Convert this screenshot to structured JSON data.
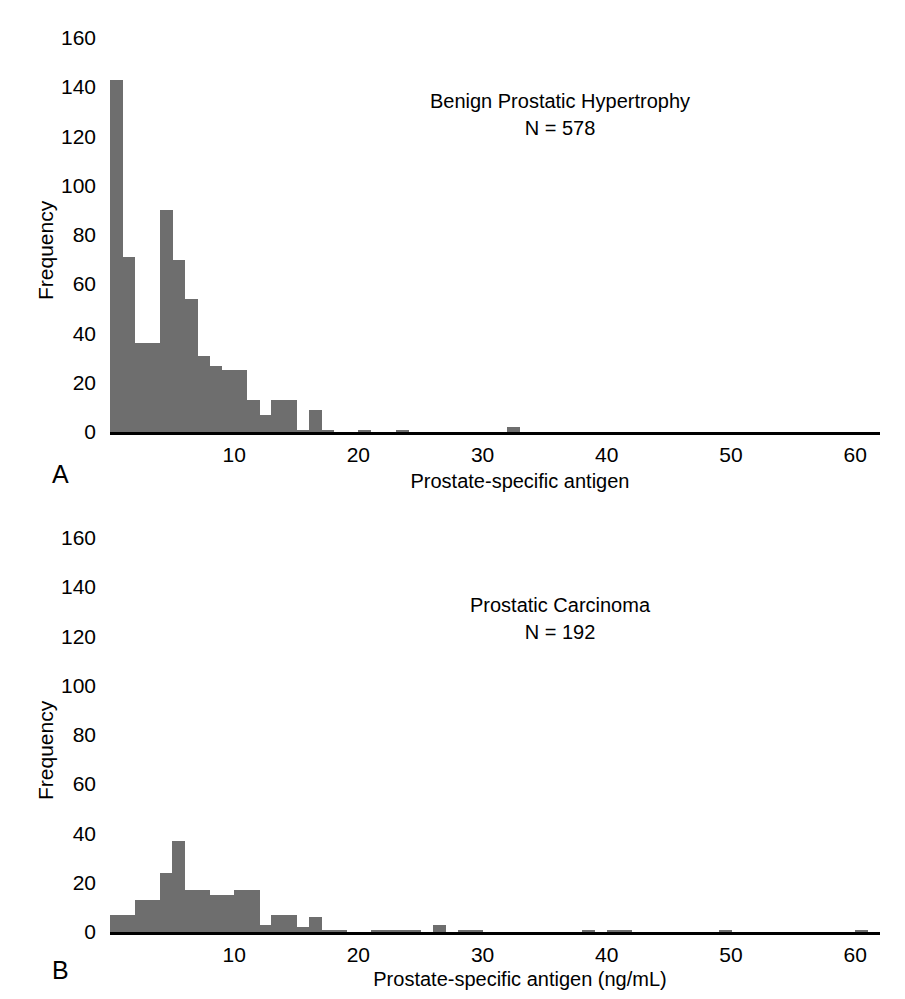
{
  "figure": {
    "background": "#ffffff",
    "bar_color": "#6e6e6e",
    "axis_color": "#000000"
  },
  "panel_a": {
    "letter": "A",
    "title_line1": "Benign Prostatic Hypertrophy",
    "title_line2": "N = 578",
    "ylabel": "Frequency",
    "xlabel": "Prostate-specific antigen",
    "yticks": [
      "160",
      "140",
      "120",
      "100",
      "80",
      "60",
      "40",
      "20",
      "0"
    ],
    "xticks": [
      "10",
      "20",
      "30",
      "40",
      "50",
      "60"
    ]
  },
  "panel_b": {
    "letter": "B",
    "title_line1": "Prostatic Carcinoma",
    "title_line2": "N = 192",
    "ylabel": "Frequency",
    "xlabel": "Prostate-specific antigen (ng/mL)",
    "yticks": [
      "160",
      "140",
      "120",
      "100",
      "80",
      "60",
      "40",
      "20",
      "0"
    ],
    "xticks": [
      "10",
      "20",
      "30",
      "40",
      "50",
      "60"
    ]
  },
  "chart_data": [
    {
      "type": "bar",
      "panel": "A",
      "title": "Benign Prostatic Hypertrophy",
      "subtitle": "N = 578",
      "xlabel": "Prostate-specific antigen",
      "ylabel": "Frequency",
      "xlim": [
        0,
        62
      ],
      "ylim": [
        0,
        160
      ],
      "xticks": [
        10,
        20,
        30,
        40,
        50,
        60
      ],
      "yticks": [
        0,
        20,
        40,
        60,
        80,
        100,
        120,
        140,
        160
      ],
      "grid": false,
      "legend": "none",
      "bin_width": 1,
      "bin_starts": [
        0,
        1,
        2,
        3,
        4,
        5,
        6,
        7,
        8,
        9,
        10,
        11,
        12,
        13,
        14,
        15,
        16,
        17,
        18,
        19,
        20,
        21,
        22,
        23,
        24,
        25,
        26,
        27,
        28,
        29,
        30,
        31,
        32,
        33
      ],
      "values": [
        143,
        71,
        36,
        36,
        90,
        70,
        54,
        31,
        27,
        25,
        25,
        13,
        7,
        13,
        13,
        1,
        9,
        1,
        0,
        0,
        1,
        0,
        0,
        1,
        0,
        0,
        0,
        0,
        0,
        0,
        0,
        0,
        2,
        0
      ],
      "categories": [
        "0-1",
        "1-2",
        "2-3",
        "3-4",
        "4-5",
        "5-6",
        "6-7",
        "7-8",
        "8-9",
        "9-10",
        "10-11",
        "11-12",
        "12-13",
        "13-14",
        "14-15",
        "15-16",
        "16-17",
        "17-18",
        "18-19",
        "19-20",
        "20-21",
        "21-22",
        "22-23",
        "23-24",
        "24-25",
        "25-26",
        "26-27",
        "27-28",
        "28-29",
        "29-30",
        "30-31",
        "31-32",
        "32-33",
        "33-34"
      ]
    },
    {
      "type": "bar",
      "panel": "B",
      "title": "Prostatic Carcinoma",
      "subtitle": "N = 192",
      "xlabel": "Prostate-specific antigen (ng/mL)",
      "ylabel": "Frequency",
      "xlim": [
        0,
        62
      ],
      "ylim": [
        0,
        160
      ],
      "xticks": [
        10,
        20,
        30,
        40,
        50,
        60
      ],
      "yticks": [
        0,
        20,
        40,
        60,
        80,
        100,
        120,
        140,
        160
      ],
      "grid": false,
      "legend": "none",
      "bin_width": 1,
      "bin_starts": [
        0,
        1,
        2,
        3,
        4,
        5,
        6,
        7,
        8,
        9,
        10,
        11,
        12,
        13,
        14,
        15,
        16,
        17,
        18,
        19,
        20,
        21,
        22,
        23,
        24,
        25,
        26,
        27,
        28,
        29,
        30,
        31,
        32,
        33,
        34,
        35,
        36,
        37,
        38,
        39,
        40,
        41,
        42,
        43,
        44,
        45,
        46,
        47,
        48,
        49,
        50,
        51,
        52,
        53,
        54,
        55,
        56,
        57,
        58,
        59,
        60,
        61
      ],
      "values": [
        7,
        7,
        13,
        13,
        24,
        37,
        17,
        17,
        15,
        15,
        17,
        17,
        3,
        7,
        7,
        2,
        6,
        1,
        1,
        0,
        0,
        1,
        1,
        1,
        1,
        0,
        3,
        0,
        1,
        1,
        0,
        0,
        0,
        0,
        0,
        0,
        0,
        0,
        1,
        0,
        1,
        1,
        0,
        0,
        0,
        0,
        0,
        0,
        0,
        1,
        0,
        0,
        0,
        0,
        0,
        0,
        0,
        0,
        0,
        0,
        1,
        0
      ],
      "categories": [
        "0-1",
        "1-2",
        "2-3",
        "3-4",
        "4-5",
        "5-6",
        "6-7",
        "7-8",
        "8-9",
        "9-10",
        "10-11",
        "11-12",
        "12-13",
        "13-14",
        "14-15",
        "15-16",
        "16-17",
        "17-18",
        "18-19",
        "19-20",
        "20-21",
        "21-22",
        "22-23",
        "23-24",
        "24-25",
        "25-26",
        "26-27",
        "27-28",
        "28-29",
        "29-30",
        "30-31",
        "31-32",
        "32-33",
        "33-34",
        "34-35",
        "35-36",
        "36-37",
        "37-38",
        "38-39",
        "39-40",
        "40-41",
        "41-42",
        "42-43",
        "43-44",
        "44-45",
        "45-46",
        "46-47",
        "47-48",
        "48-49",
        "49-50",
        "50-51",
        "51-52",
        "52-53",
        "53-54",
        "54-55",
        "55-56",
        "56-57",
        "57-58",
        "58-59",
        "59-60",
        "60-61",
        "61-62"
      ]
    }
  ]
}
